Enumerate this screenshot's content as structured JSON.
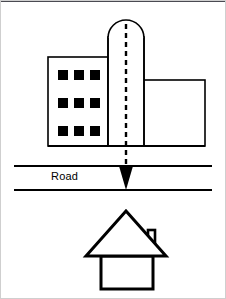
{
  "figure": {
    "title": "",
    "background_color": "#ffffff",
    "stroke_color": "#000000",
    "frame_color": "#cfcfcf",
    "top_rule_color": "#4a4a52"
  },
  "labels": {
    "road": "Road"
  },
  "office_building": {
    "name": "office-building",
    "left_block": {
      "x": 48,
      "y": 57,
      "width": 60,
      "height": 89,
      "windows": {
        "rows": 3,
        "cols": 3,
        "count": 9,
        "size": 9,
        "fill": "#000000",
        "positions": [
          {
            "x": 58,
            "y": 71
          },
          {
            "x": 74,
            "y": 71
          },
          {
            "x": 90,
            "y": 71
          },
          {
            "x": 58,
            "y": 99
          },
          {
            "x": 74,
            "y": 99
          },
          {
            "x": 90,
            "y": 99
          },
          {
            "x": 58,
            "y": 126
          },
          {
            "x": 74,
            "y": 126
          },
          {
            "x": 126,
            "y": 126
          }
        ]
      }
    },
    "tower": {
      "x": 108,
      "y": 37,
      "width": 36,
      "height": 109
    },
    "arch": {
      "cx": 126,
      "cy": 37,
      "radius": 18
    },
    "right_wing": {
      "x": 144,
      "y": 80,
      "width": 61,
      "height": 66
    }
  },
  "flow_arrow": {
    "name": "dashed-flow-arrow",
    "style": "dashed",
    "direction": "down",
    "from": {
      "x": 126,
      "y": 24
    },
    "to": {
      "x": 126,
      "y": 190
    },
    "head_width": 14,
    "head_height": 22
  },
  "road": {
    "name": "road",
    "top_line_y": 166,
    "bottom_line_y": 190,
    "x_start": 14,
    "x_end": 212,
    "label_x": 51,
    "label_y": 176
  },
  "house": {
    "name": "house",
    "roof": {
      "apex_x": 126,
      "apex_y": 212,
      "left_x": 88,
      "right_x": 164,
      "base_y": 257
    },
    "body": {
      "x": 101,
      "y": 257,
      "width": 52,
      "height": 32
    },
    "chimney": {
      "x": 148,
      "y": 232,
      "width": 7,
      "height": 18
    }
  }
}
